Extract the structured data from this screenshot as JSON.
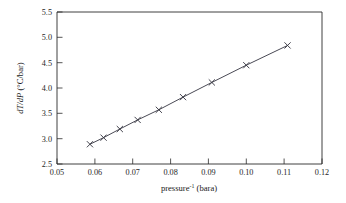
{
  "chart_data": {
    "type": "line",
    "title": "",
    "xlabel": "pressure⁻¹ (bara)",
    "xlabel_base": "pressure",
    "xlabel_sup": "-1",
    "xlabel_unit": "(bara)",
    "ylabel": "dT/dP (°C/bar)",
    "ylabel_ital": "dT/dP",
    "ylabel_unit": "(°C/bar)",
    "xlim": [
      0.05,
      0.12
    ],
    "ylim": [
      2.5,
      5.5
    ],
    "xticks": [
      "0.05",
      "0.06",
      "0.07",
      "0.08",
      "0.09",
      "0.10",
      "0.11",
      "0.12"
    ],
    "xtick_values": [
      0.05,
      0.06,
      0.07,
      0.08,
      0.09,
      0.1,
      0.11,
      0.12
    ],
    "yticks": [
      "2.5",
      "3.0",
      "3.5",
      "4.0",
      "4.5",
      "5.0",
      "5.5"
    ],
    "ytick_values": [
      2.5,
      3.0,
      3.5,
      4.0,
      4.5,
      5.0,
      5.5
    ],
    "grid": false,
    "legend": null,
    "marker": "x",
    "line_color": "#4a4a55",
    "marker_color": "#3a3a45",
    "series": [
      {
        "name": "dT/dP vs pressure-1",
        "x": [
          0.0587,
          0.0623,
          0.0666,
          0.0713,
          0.0769,
          0.0833,
          0.0909,
          0.1,
          0.1109
        ],
        "y": [
          2.89,
          3.02,
          3.19,
          3.37,
          3.57,
          3.82,
          4.11,
          4.45,
          4.84
        ]
      }
    ]
  },
  "axes": {
    "x_axis_name": "x-axis",
    "y_axis_name": "y-axis"
  }
}
